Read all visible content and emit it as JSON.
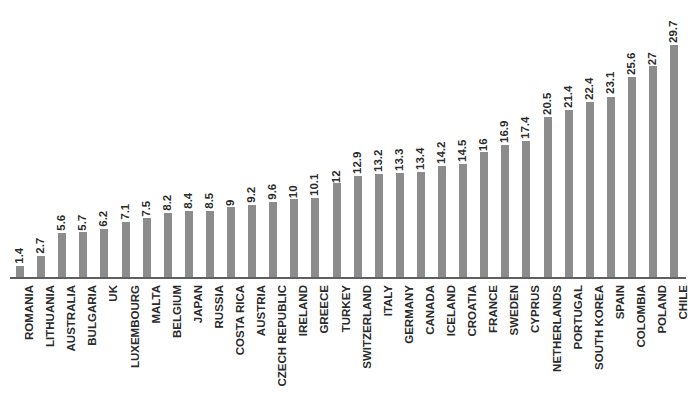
{
  "chart_data": {
    "type": "bar",
    "title": "",
    "subtitle": "",
    "xlabel": "",
    "ylabel": "",
    "ylim": [
      0,
      29.7
    ],
    "grid": false,
    "legend": false,
    "orientation": "vertical",
    "bar_color": "#8c8c8c",
    "axis_color": "#5f5f5f",
    "background": "#ffffff",
    "label_color": "#2b2b2b",
    "data_labels_shown": true,
    "axis_tick_labels_shown": false,
    "categories": [
      "ROMANIA",
      "LITHUANIA",
      "AUSTRALIA",
      "BULGARIA",
      "UK",
      "LUXEMBOURG",
      "MALTA",
      "BELGIUM",
      "JAPAN",
      "RUSSIA",
      "COSTA RICA",
      "AUSTRIA",
      "CZECH REPUBLIC",
      "IRELAND",
      "GREECE",
      "TURKEY",
      "SWITZERLAND",
      "ITALY",
      "GERMANY",
      "CANADA",
      "ICELAND",
      "CROATIA",
      "FRANCE",
      "SWEDEN",
      "CYPRUS",
      "NETHERLANDS",
      "PORTUGAL",
      "SOUTH KOREA",
      "SPAIN",
      "COLOMBIA",
      "POLAND",
      "CHILE"
    ],
    "values": [
      1.4,
      2.7,
      5.6,
      5.7,
      6.2,
      7.1,
      7.5,
      8.2,
      8.4,
      8.5,
      9,
      9.2,
      9.6,
      10,
      10.1,
      12,
      12.9,
      13.2,
      13.3,
      13.4,
      14.2,
      14.5,
      16,
      16.9,
      17.4,
      20.5,
      21.4,
      22.4,
      23.1,
      25.6,
      27,
      29.7
    ],
    "value_labels": [
      "1.4",
      "2.7",
      "5.6",
      "5.7",
      "6.2",
      "7.1",
      "7.5",
      "8.2",
      "8.4",
      "8.5",
      "9",
      "9.2",
      "9.6",
      "10",
      "10.1",
      "12",
      "12.9",
      "13.2",
      "13.3",
      "13.4",
      "14.2",
      "14.5",
      "16",
      "16.9",
      "17.4",
      "20.5",
      "21.4",
      "22.4",
      "23.1",
      "25.6",
      "27",
      "29.7"
    ]
  }
}
